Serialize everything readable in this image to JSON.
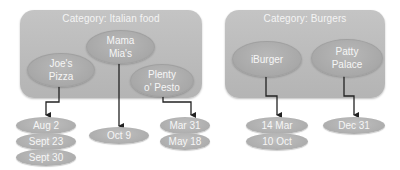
{
  "categories": [
    {
      "title": "Category: Italian food",
      "restaurants": [
        {
          "name": "Joe's\nPizza",
          "dates": [
            "Aug 2",
            "Sept 23",
            "Sept 30"
          ]
        },
        {
          "name": "Mama\nMia's",
          "dates": [
            "Oct 9"
          ]
        },
        {
          "name": "Plenty\no' Pesto",
          "dates": [
            "Mar 31",
            "May 18"
          ]
        }
      ]
    },
    {
      "title": "Category: Burgers",
      "restaurants": [
        {
          "name": "iBurger",
          "dates": [
            "14 Mar",
            "10 Oct"
          ]
        },
        {
          "name": "Patty\nPalace",
          "dates": [
            "Dec 31"
          ]
        }
      ]
    }
  ],
  "colors": {
    "category_fill": "#bcbcbc",
    "node_fill": "#ababab",
    "text": "#f6f6f6",
    "connector": "#222222"
  }
}
